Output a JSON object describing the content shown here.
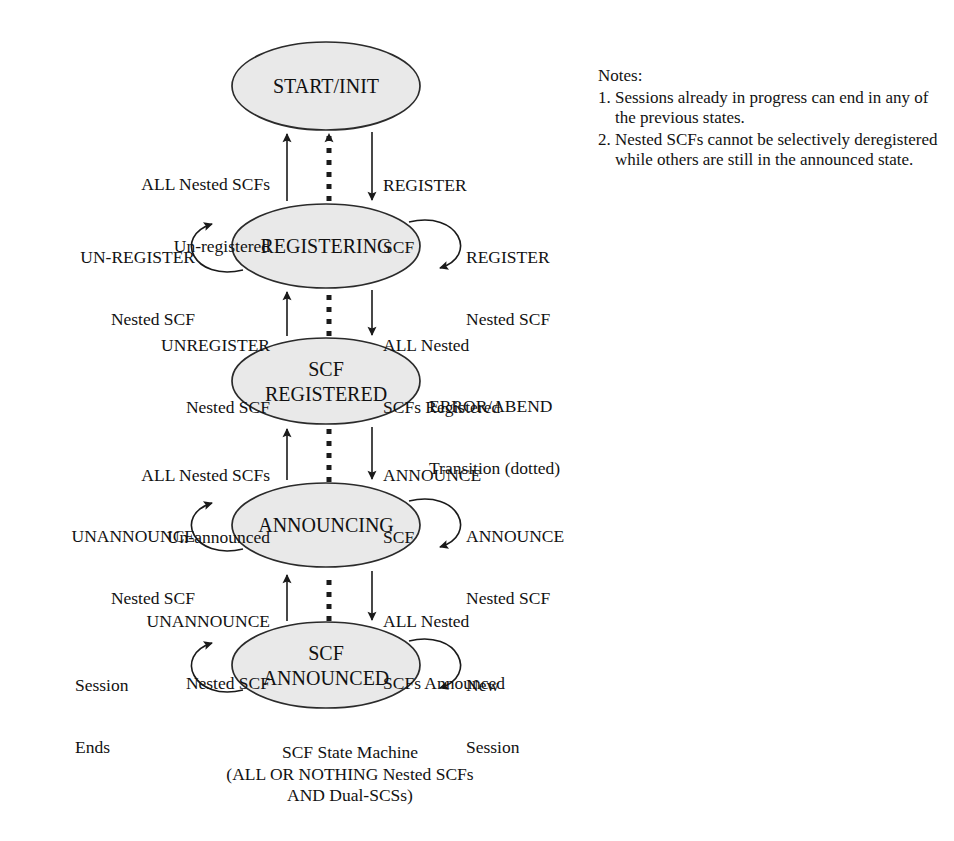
{
  "diagram": {
    "title": "SCF State Machine",
    "style": {
      "state_fill": "#e9e9e9",
      "state_stroke": "#2b2b2b",
      "edge_color": "#1a1a1a",
      "background": "#ffffff"
    },
    "states": [
      {
        "id": "start",
        "label_lines": [
          "START/INIT"
        ],
        "cx": 326,
        "cy": 86,
        "rx": 94,
        "ry": 44
      },
      {
        "id": "registering",
        "label_lines": [
          "REGISTERING"
        ],
        "cx": 326,
        "cy": 246,
        "rx": 94,
        "ry": 42
      },
      {
        "id": "scf_registered",
        "label_lines": [
          "SCF",
          "REGISTERED"
        ],
        "cx": 326,
        "cy": 381,
        "rx": 94,
        "ry": 43
      },
      {
        "id": "announcing",
        "label_lines": [
          "ANNOUNCING"
        ],
        "cx": 326,
        "cy": 525,
        "rx": 94,
        "ry": 42
      },
      {
        "id": "scf_announced",
        "label_lines": [
          "SCF",
          "ANNOUNCED"
        ],
        "cx": 326,
        "cy": 665,
        "rx": 94,
        "ry": 43
      }
    ],
    "transitions": [
      {
        "id": "t-all-nested-unregistered",
        "label_lines": [
          "ALL Nested SCFs",
          "Un-registered"
        ],
        "from": "registering",
        "to": "start",
        "kind": "solid",
        "direction": "up"
      },
      {
        "id": "t-error-abend-registering",
        "label_lines": [],
        "from": "registering",
        "to": "start",
        "kind": "dotted",
        "direction": "up"
      },
      {
        "id": "t-register-scf",
        "label_lines": [
          "REGISTER",
          "SCF"
        ],
        "from": "start",
        "to": "registering",
        "kind": "solid",
        "direction": "down"
      },
      {
        "id": "t-unregister-nested-scf",
        "label_lines": [
          "UNREGISTER",
          "Nested SCF"
        ],
        "from": "scf_registered",
        "to": "registering",
        "kind": "solid",
        "direction": "up"
      },
      {
        "id": "t-error-abend-scf-registered",
        "label_lines": [],
        "from": "scf_registered",
        "to": "registering",
        "kind": "dotted",
        "direction": "up"
      },
      {
        "id": "t-all-nested-scfs-registered",
        "label_lines": [
          "ALL Nested",
          "SCFs Registered"
        ],
        "from": "registering",
        "to": "scf_registered",
        "kind": "solid",
        "direction": "down"
      },
      {
        "id": "t-all-nested-unannounced",
        "label_lines": [
          "ALL Nested SCFs",
          "Un-announced"
        ],
        "from": "announcing",
        "to": "scf_registered",
        "kind": "solid",
        "direction": "up"
      },
      {
        "id": "t-error-abend-announcing",
        "label_lines": [],
        "from": "announcing",
        "to": "scf_registered",
        "kind": "dotted",
        "direction": "up"
      },
      {
        "id": "t-announce-scf",
        "label_lines": [
          "ANNOUNCE",
          "SCF"
        ],
        "from": "scf_registered",
        "to": "announcing",
        "kind": "solid",
        "direction": "down"
      },
      {
        "id": "t-unannounce-nested-scf",
        "label_lines": [
          "UNANNOUNCE",
          "Nested SCF"
        ],
        "from": "scf_announced",
        "to": "announcing",
        "kind": "solid",
        "direction": "up"
      },
      {
        "id": "t-error-abend-scf-announced",
        "label_lines": [],
        "from": "scf_announced",
        "to": "announcing",
        "kind": "dotted",
        "direction": "up"
      },
      {
        "id": "t-all-nested-scfs-announced",
        "label_lines": [
          "ALL Nested",
          "SCFs Announced"
        ],
        "from": "announcing",
        "to": "scf_announced",
        "kind": "solid",
        "direction": "down"
      }
    ],
    "self_loops": [
      {
        "id": "loop-un-register-nested-scf",
        "state": "registering",
        "side": "left",
        "label_lines": [
          "UN-REGISTER",
          "Nested SCF"
        ]
      },
      {
        "id": "loop-register-nested-scf",
        "state": "registering",
        "side": "right",
        "label_lines": [
          "REGISTER",
          "Nested SCF"
        ]
      },
      {
        "id": "loop-unannounce-nested-scf",
        "state": "announcing",
        "side": "left",
        "label_lines": [
          "UNANNOUNCE",
          "Nested SCF"
        ]
      },
      {
        "id": "loop-announce-nested-scf",
        "state": "announcing",
        "side": "right",
        "label_lines": [
          "ANNOUNCE",
          "Nested SCF"
        ]
      },
      {
        "id": "loop-session-ends",
        "state": "scf_announced",
        "side": "left",
        "label_lines": [
          "Session",
          "Ends"
        ]
      },
      {
        "id": "loop-new-session-request",
        "state": "scf_announced",
        "side": "right",
        "label_lines": [
          "New",
          "Session",
          "Request"
        ]
      }
    ],
    "annotations": [
      {
        "id": "error-abend-legend",
        "label_lines": [
          "ERROR/ABEND",
          "Transition (dotted)"
        ]
      }
    ],
    "caption_lines": [
      "SCF State Machine",
      "(ALL OR NOTHING Nested SCFs",
      "AND Dual-SCSs)"
    ]
  },
  "notes": {
    "heading": "Notes:",
    "items": [
      {
        "number": "1.",
        "text": "Sessions already in progress can end in any of the previous states."
      },
      {
        "number": "2.",
        "text": "Nested SCFs cannot be selectively deregistered while others are still in the announced state."
      }
    ]
  }
}
